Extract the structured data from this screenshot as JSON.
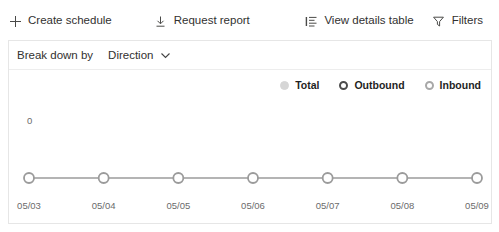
{
  "toolbar": {
    "buttons": [
      {
        "label": "Create schedule",
        "icon": "plus-icon"
      },
      {
        "label": "Request report",
        "icon": "download-icon"
      },
      {
        "label": "View details table",
        "icon": "list-icon"
      },
      {
        "label": "Filters",
        "icon": "funnel-icon"
      }
    ]
  },
  "breakdown": {
    "label": "Break down by",
    "value": "Direction",
    "chevron": "chevron-down-icon"
  },
  "legend": {
    "items": [
      {
        "label": "Total",
        "color": "#d6d6d6",
        "style": "filled"
      },
      {
        "label": "Outbound",
        "color": "#4c4c4c",
        "style": "ring"
      },
      {
        "label": "Inbound",
        "color": "#a8a8a8",
        "style": "ring"
      }
    ]
  },
  "chart_data": {
    "type": "line",
    "title": "",
    "xlabel": "",
    "ylabel": "",
    "categories": [
      "05/03",
      "05/04",
      "05/05",
      "05/06",
      "05/07",
      "05/08",
      "05/09"
    ],
    "series": [
      {
        "name": "Total",
        "values": [
          0,
          0,
          0,
          0,
          0,
          0,
          0
        ]
      }
    ],
    "ytick_labels": [
      "0"
    ],
    "ylim": [
      0,
      0
    ],
    "grid": false,
    "legend_position": "top-right",
    "line_color": "#9b9b9b",
    "marker_fill": "#ffffff",
    "marker_stroke": "#9b9b9b"
  }
}
